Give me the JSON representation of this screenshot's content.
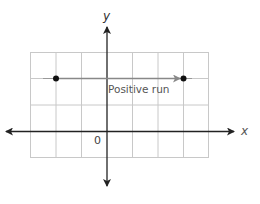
{
  "diagram": {
    "axes": {
      "x_label": "x",
      "y_label": "y",
      "origin_label": "0"
    },
    "annotation": {
      "label": "Positive run"
    },
    "grid": {
      "columns": 7,
      "rows": 4
    },
    "points": [
      {
        "name": "start-point",
        "grid_x": -2,
        "grid_y": 2
      },
      {
        "name": "end-point",
        "grid_x": 3,
        "grid_y": 2
      }
    ],
    "colors": {
      "grid": "#c8c8c8",
      "axis": "#222222",
      "run_arrow": "#888888",
      "point": "#111111",
      "label": "#555555"
    }
  }
}
